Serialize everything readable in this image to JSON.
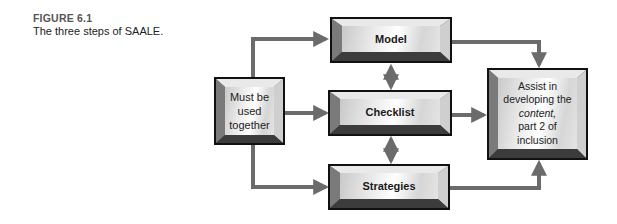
{
  "caption": {
    "label": "FIGURE 6.1",
    "title": "The three steps of SAALE."
  },
  "nodes": {
    "source": {
      "lines": [
        "Must  be",
        "used",
        "together"
      ]
    },
    "model": {
      "label": "Model"
    },
    "checklist": {
      "label": "Checklist"
    },
    "strategies": {
      "label": "Strategies"
    },
    "result": {
      "lines": [
        "Assist in",
        "developing the",
        "content,",
        "part 2 of",
        "inclusion"
      ],
      "italic_line": "content,"
    }
  },
  "edges": [
    {
      "from": "source",
      "to": "model",
      "type": "arrow"
    },
    {
      "from": "source",
      "to": "checklist",
      "type": "arrow"
    },
    {
      "from": "source",
      "to": "strategies",
      "type": "arrow"
    },
    {
      "from": "model",
      "to": "checklist",
      "type": "double-arrow"
    },
    {
      "from": "checklist",
      "to": "strategies",
      "type": "double-arrow"
    },
    {
      "from": "model",
      "to": "result",
      "type": "arrow"
    },
    {
      "from": "checklist",
      "to": "result",
      "type": "arrow"
    },
    {
      "from": "strategies",
      "to": "result",
      "type": "arrow"
    }
  ],
  "colors": {
    "connector": "#6b6b6b",
    "box_border": "#111111",
    "bevel_dark": "#3a3a3a",
    "bevel_light": "#e6e6e6"
  }
}
